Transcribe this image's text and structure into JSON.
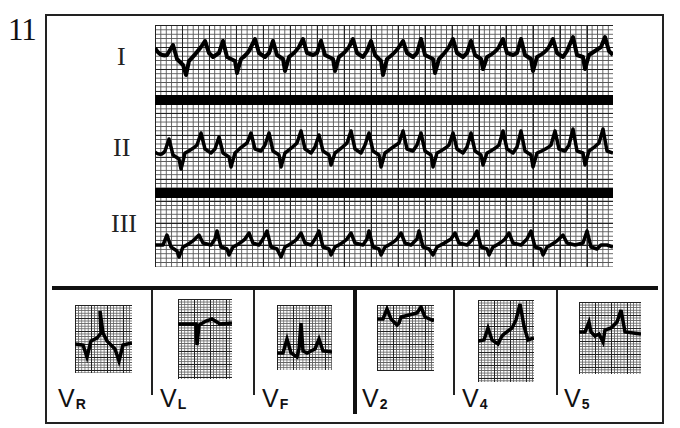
{
  "figure": {
    "number": "11"
  },
  "limb_leads": {
    "labels": [
      "I",
      "II",
      "III"
    ]
  },
  "chest_leads": [
    {
      "main": "V",
      "sub": "R"
    },
    {
      "main": "V",
      "sub": "L"
    },
    {
      "main": "V",
      "sub": "F"
    },
    {
      "main": "V",
      "sub": "2"
    },
    {
      "main": "V",
      "sub": "4"
    },
    {
      "main": "V",
      "sub": "5"
    }
  ],
  "colors": {
    "ink": "#111111",
    "paper": "#ffffff",
    "grid_major": "#222222",
    "grid_minor": "#555555"
  }
}
